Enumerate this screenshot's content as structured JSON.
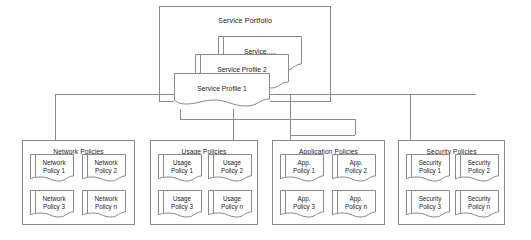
{
  "diagram": {
    "portfolio": {
      "label": "Service Portfolio",
      "cards": [
        {
          "label": "Service....."
        },
        {
          "label": "Service Profile 2"
        },
        {
          "label": "Service Profile 1"
        }
      ]
    },
    "groups": [
      {
        "label": "Network Policies",
        "items": [
          {
            "line1": "Network",
            "line2": "Policy 1"
          },
          {
            "line1": "Network",
            "line2": "Policy 2"
          },
          {
            "line1": "Network",
            "line2": "Policy 3"
          },
          {
            "line1": "Network",
            "line2": "Policy n"
          }
        ]
      },
      {
        "label": "Usage Policies",
        "items": [
          {
            "line1": "Usage",
            "line2": "Policy 1"
          },
          {
            "line1": "Usage",
            "line2": "Policy 2"
          },
          {
            "line1": "Usage",
            "line2": "Policy 3"
          },
          {
            "line1": "Usage",
            "line2": "Policy n"
          }
        ]
      },
      {
        "label": "Application Policies",
        "items": [
          {
            "line1": "App.",
            "line2": "Policy 1"
          },
          {
            "line1": "App.",
            "line2": "Policy 2"
          },
          {
            "line1": "App.",
            "line2": "Policy 3"
          },
          {
            "line1": "App.",
            "line2": "Policy n"
          }
        ]
      },
      {
        "label": "Security Policies",
        "items": [
          {
            "line1": "Security",
            "line2": "Policy 1"
          },
          {
            "line1": "Security",
            "line2": "Policy 2"
          },
          {
            "line1": "Security",
            "line2": "Policy 3"
          },
          {
            "line1": "Security",
            "line2": "Policy n"
          }
        ]
      }
    ],
    "colors": {
      "stroke": "#8a8a8a",
      "connector": "#8a8a8a",
      "text": "#1d1d1d",
      "background": "#ffffff"
    }
  }
}
